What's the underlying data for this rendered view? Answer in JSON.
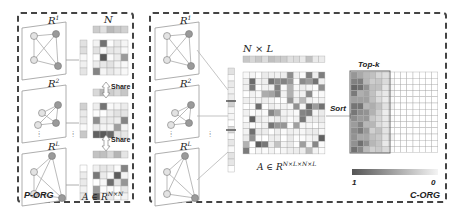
{
  "p_org": {
    "label": "P-ORG",
    "graphs": [
      {
        "label": "R",
        "sup": "1"
      },
      {
        "label": "R",
        "sup": "2"
      },
      {
        "label": "R",
        "sup": "L"
      }
    ],
    "matrix_top_label": "N",
    "share_label": "Share",
    "matrix_bottom_label": "A ∈ R",
    "matrix_bottom_sup": "N×N"
  },
  "c_org": {
    "label": "C-ORG",
    "graphs": [
      {
        "label": "R",
        "sup": "1"
      },
      {
        "label": "R",
        "sup": "2"
      },
      {
        "label": "R",
        "sup": "L"
      }
    ],
    "matrix_top_label": "N × L",
    "matrix_bottom_label": "A ∈ R",
    "matrix_bottom_sup": "N×L×N×L",
    "sort_label": "Sort",
    "topk_label": "Top-k",
    "colorbar": {
      "min_label": "0",
      "max_label": "1",
      "dark": "#555555",
      "light": "#f4f4f4"
    }
  },
  "colors": {
    "border": "#444444",
    "node_dark": "#9a9a9a",
    "node_light": "#e3e3e3",
    "edge": "#999999"
  }
}
